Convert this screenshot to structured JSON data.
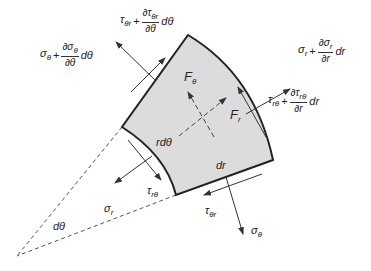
{
  "diagram": {
    "colors": {
      "element_fill": "#dcdcdc",
      "element_stroke": "#222222",
      "arrow": "#333333",
      "dashed": "#555555"
    },
    "labels": {
      "F_theta": {
        "base": "F",
        "sub": "θ"
      },
      "F_r": {
        "base": "F",
        "sub": "r"
      },
      "r_dtheta": "rdθ",
      "dr": "dr",
      "dtheta": "dθ",
      "sigma_r": {
        "base": "σ",
        "sub": "r"
      },
      "sigma_theta": {
        "base": "σ",
        "sub": "θ"
      },
      "tau_r_theta": {
        "base": "τ",
        "sub": "rθ"
      },
      "tau_theta_r": {
        "base": "τ",
        "sub": "θr"
      },
      "sigma_theta_plus": {
        "base": "σ",
        "sub": "θ",
        "plus": "+",
        "num": "∂σ",
        "num_sub": "θ",
        "den": "∂θ",
        "tail": "dθ"
      },
      "tau_theta_r_plus": {
        "base": "τ",
        "sub": "θr",
        "plus": "+",
        "num": "∂τ",
        "num_sub": "θr",
        "den": "∂θ",
        "tail": "dθ"
      },
      "sigma_r_plus": {
        "base": "σ",
        "sub": "r",
        "plus": "+",
        "num": "∂σ",
        "num_sub": "r",
        "den": "∂r",
        "tail": "dr"
      },
      "tau_r_theta_plus": {
        "base": "τ",
        "sub": "rθ",
        "plus": "+",
        "num": "∂τ",
        "num_sub": "rθ",
        "den": "∂r",
        "tail": "dr"
      }
    }
  }
}
